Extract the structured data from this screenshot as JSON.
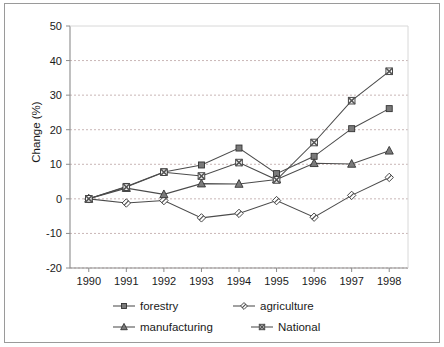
{
  "chart_data": {
    "type": "line",
    "title": "",
    "xlabel": "",
    "ylabel": "Change (%)",
    "categories": [
      "1990",
      "1991",
      "1992",
      "1993",
      "1994",
      "1995",
      "1996",
      "1997",
      "1998"
    ],
    "x": [
      1990,
      1991,
      1992,
      1993,
      1994,
      1995,
      1996,
      1997,
      1998
    ],
    "ylim": [
      -20,
      50
    ],
    "yticks": [
      -20,
      -10,
      0,
      10,
      20,
      30,
      40,
      50
    ],
    "ytick_labels": [
      "-20",
      "-10",
      "0",
      "10",
      "20",
      "30",
      "40",
      "50"
    ],
    "grid": "horizontal-dotted",
    "legend_position": "bottom",
    "series": [
      {
        "name": "forestry",
        "marker": "filled-square",
        "values": [
          0,
          3.6,
          7.8,
          9.8,
          14.7,
          7.3,
          12.3,
          20.3,
          26.1
        ]
      },
      {
        "name": "agriculture",
        "marker": "slashed-diamond",
        "values": [
          0,
          -1.2,
          -0.5,
          -5.5,
          -4.2,
          -0.5,
          -5.3,
          1.0,
          6.2
        ]
      },
      {
        "name": "manufacturing",
        "marker": "filled-triangle",
        "values": [
          0,
          3.1,
          1.3,
          4.4,
          4.3,
          5.6,
          10.3,
          10.1,
          13.9
        ]
      },
      {
        "name": "National",
        "marker": "crossed-square",
        "values": [
          0,
          3.4,
          7.7,
          6.6,
          10.5,
          5.5,
          16.3,
          28.4,
          36.9
        ]
      }
    ],
    "colors": {
      "line": "#4b4b4b",
      "marker_fill": "#7a7a7a",
      "marker_edge": "#333333",
      "gridline": "#c9b6b6",
      "axis": "#8c8c8c",
      "text": "#1a1a1a",
      "background": "#ffffff",
      "frame": "#9a9a9a"
    }
  },
  "axis": {
    "y_title": "Change (%)"
  },
  "legend": {
    "entries": [
      {
        "label": "forestry"
      },
      {
        "label": "agriculture"
      },
      {
        "label": "manufacturing"
      },
      {
        "label": "National"
      }
    ]
  }
}
